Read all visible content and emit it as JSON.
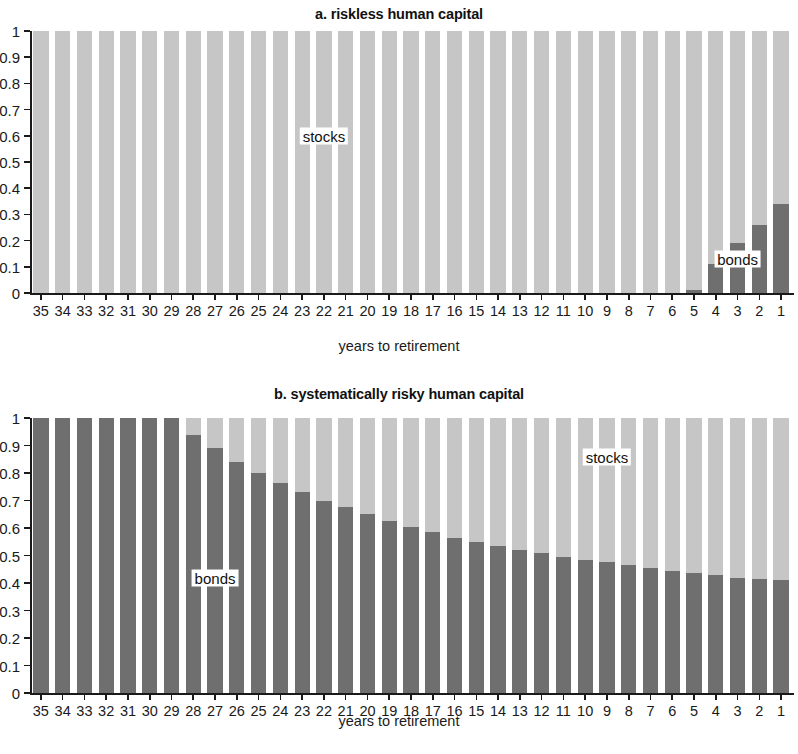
{
  "figure": {
    "xlabel": "years to retirement",
    "series_labels": {
      "stocks": "stocks",
      "bonds": "bonds"
    },
    "colors": {
      "stocks": "#c6c6c6",
      "bonds": "#6f6f6f",
      "axis": "#1a1a1a",
      "background": "#ffffff"
    },
    "y_ticks": [
      "0",
      "0.1",
      "0.2",
      "0.3",
      "0.4",
      "0.5",
      "0.6",
      "0.7",
      "0.8",
      "0.9",
      "1"
    ]
  },
  "chart_data": [
    {
      "type": "bar",
      "stacked": true,
      "title": "a. riskless human capital",
      "xlabel": "years to retirement",
      "ylabel": "",
      "ylim": [
        0,
        1
      ],
      "grid": false,
      "legend_position": "inline-annotation",
      "categories": [
        "35",
        "34",
        "33",
        "32",
        "31",
        "30",
        "29",
        "28",
        "27",
        "26",
        "25",
        "24",
        "23",
        "22",
        "21",
        "20",
        "19",
        "18",
        "17",
        "16",
        "15",
        "14",
        "13",
        "12",
        "11",
        "10",
        "9",
        "8",
        "7",
        "6",
        "5",
        "4",
        "3",
        "2",
        "1"
      ],
      "series": [
        {
          "name": "bonds",
          "values": [
            0,
            0,
            0,
            0,
            0,
            0,
            0,
            0,
            0,
            0,
            0,
            0,
            0,
            0,
            0,
            0,
            0,
            0,
            0,
            0,
            0,
            0,
            0,
            0,
            0,
            0,
            0,
            0,
            0,
            0,
            0.01,
            0.11,
            0.19,
            0.26,
            0.34
          ]
        },
        {
          "name": "stocks",
          "values": [
            1,
            1,
            1,
            1,
            1,
            1,
            1,
            1,
            1,
            1,
            1,
            1,
            1,
            1,
            1,
            1,
            1,
            1,
            1,
            1,
            1,
            1,
            1,
            1,
            1,
            1,
            1,
            1,
            1,
            1,
            0.99,
            0.89,
            0.81,
            0.74,
            0.66
          ]
        }
      ],
      "annotations": [
        {
          "text": "stocks",
          "x_category": "22",
          "y": 0.6
        },
        {
          "text": "bonds",
          "x_category": "3",
          "y": 0.13
        }
      ]
    },
    {
      "type": "bar",
      "stacked": true,
      "title": "b. systematically risky human capital",
      "xlabel": "years to retirement",
      "ylabel": "",
      "ylim": [
        0,
        1
      ],
      "grid": false,
      "legend_position": "inline-annotation",
      "categories": [
        "35",
        "34",
        "33",
        "32",
        "31",
        "30",
        "29",
        "28",
        "27",
        "26",
        "25",
        "24",
        "23",
        "22",
        "21",
        "20",
        "19",
        "18",
        "17",
        "16",
        "15",
        "14",
        "13",
        "12",
        "11",
        "10",
        "9",
        "8",
        "7",
        "6",
        "5",
        "4",
        "3",
        "2",
        "1"
      ],
      "series": [
        {
          "name": "bonds",
          "values": [
            1,
            1,
            1,
            1,
            1,
            1,
            1,
            0.94,
            0.89,
            0.84,
            0.8,
            0.765,
            0.73,
            0.7,
            0.675,
            0.65,
            0.625,
            0.605,
            0.585,
            0.565,
            0.55,
            0.535,
            0.52,
            0.51,
            0.495,
            0.485,
            0.475,
            0.465,
            0.455,
            0.445,
            0.435,
            0.43,
            0.42,
            0.415,
            0.41
          ]
        },
        {
          "name": "stocks",
          "values": [
            0,
            0,
            0,
            0,
            0,
            0,
            0,
            0.06,
            0.11,
            0.16,
            0.2,
            0.235,
            0.27,
            0.3,
            0.325,
            0.35,
            0.375,
            0.395,
            0.415,
            0.435,
            0.45,
            0.465,
            0.48,
            0.49,
            0.505,
            0.515,
            0.525,
            0.535,
            0.545,
            0.555,
            0.565,
            0.57,
            0.58,
            0.585,
            0.59
          ]
        }
      ],
      "annotations": [
        {
          "text": "bonds",
          "x_category": "27",
          "y": 0.42
        },
        {
          "text": "stocks",
          "x_category": "9",
          "y": 0.86
        }
      ]
    }
  ]
}
